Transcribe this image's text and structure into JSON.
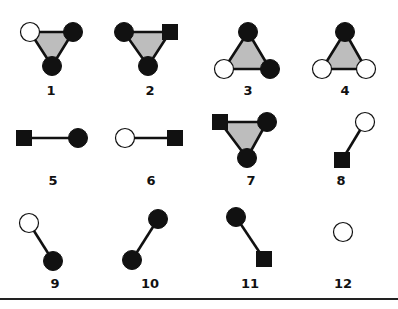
{
  "figure": {
    "legend": {
      "black": "filled black circle node",
      "white": "open white circle node",
      "square": "filled black square node"
    },
    "colors": {
      "stroke": "#111111",
      "triangle_fill": "#bdbdbd",
      "background": "#ffffff"
    },
    "motifs": [
      {
        "id": 1,
        "label": "1",
        "type": "triangle",
        "nodes": [
          {
            "kind": "white",
            "x": 30,
            "y": 32
          },
          {
            "kind": "black",
            "x": 73,
            "y": 32
          },
          {
            "kind": "black",
            "x": 52,
            "y": 66
          }
        ],
        "label_pos": {
          "x": 51,
          "y": 95
        }
      },
      {
        "id": 2,
        "label": "2",
        "type": "triangle",
        "nodes": [
          {
            "kind": "black",
            "x": 124,
            "y": 32
          },
          {
            "kind": "square",
            "x": 170,
            "y": 32
          },
          {
            "kind": "black",
            "x": 148,
            "y": 66
          }
        ],
        "label_pos": {
          "x": 150,
          "y": 95
        }
      },
      {
        "id": 3,
        "label": "3",
        "type": "triangle",
        "nodes": [
          {
            "kind": "black",
            "x": 248,
            "y": 32
          },
          {
            "kind": "white",
            "x": 224,
            "y": 69
          },
          {
            "kind": "black",
            "x": 270,
            "y": 69
          }
        ],
        "label_pos": {
          "x": 248,
          "y": 95
        }
      },
      {
        "id": 4,
        "label": "4",
        "type": "triangle",
        "nodes": [
          {
            "kind": "black",
            "x": 345,
            "y": 32
          },
          {
            "kind": "white",
            "x": 322,
            "y": 69
          },
          {
            "kind": "white",
            "x": 366,
            "y": 69
          }
        ],
        "label_pos": {
          "x": 345,
          "y": 95
        }
      },
      {
        "id": 5,
        "label": "5",
        "type": "edge",
        "nodes": [
          {
            "kind": "square",
            "x": 24,
            "y": 138
          },
          {
            "kind": "black",
            "x": 78,
            "y": 138
          }
        ],
        "label_pos": {
          "x": 53,
          "y": 185
        }
      },
      {
        "id": 6,
        "label": "6",
        "type": "edge",
        "nodes": [
          {
            "kind": "white",
            "x": 125,
            "y": 138
          },
          {
            "kind": "square",
            "x": 175,
            "y": 138
          }
        ],
        "label_pos": {
          "x": 151,
          "y": 185
        }
      },
      {
        "id": 7,
        "label": "7",
        "type": "triangle",
        "nodes": [
          {
            "kind": "square",
            "x": 220,
            "y": 122
          },
          {
            "kind": "black",
            "x": 267,
            "y": 122
          },
          {
            "kind": "black",
            "x": 247,
            "y": 158
          }
        ],
        "label_pos": {
          "x": 251,
          "y": 185
        }
      },
      {
        "id": 8,
        "label": "8",
        "type": "edge",
        "nodes": [
          {
            "kind": "white",
            "x": 365,
            "y": 122
          },
          {
            "kind": "square",
            "x": 342,
            "y": 160
          }
        ],
        "label_pos": {
          "x": 341,
          "y": 185
        }
      },
      {
        "id": 9,
        "label": "9",
        "type": "edge",
        "nodes": [
          {
            "kind": "white",
            "x": 29,
            "y": 223
          },
          {
            "kind": "black",
            "x": 53,
            "y": 261
          }
        ],
        "label_pos": {
          "x": 55,
          "y": 288
        }
      },
      {
        "id": 10,
        "label": "10",
        "type": "edge",
        "nodes": [
          {
            "kind": "black",
            "x": 158,
            "y": 219
          },
          {
            "kind": "black",
            "x": 132,
            "y": 260
          }
        ],
        "label_pos": {
          "x": 150,
          "y": 288
        }
      },
      {
        "id": 11,
        "label": "11",
        "type": "edge",
        "nodes": [
          {
            "kind": "black",
            "x": 236,
            "y": 217
          },
          {
            "kind": "square",
            "x": 264,
            "y": 259
          }
        ],
        "label_pos": {
          "x": 250,
          "y": 288
        }
      },
      {
        "id": 12,
        "label": "12",
        "type": "single",
        "nodes": [
          {
            "kind": "white",
            "x": 343,
            "y": 232
          }
        ],
        "label_pos": {
          "x": 343,
          "y": 288
        }
      }
    ],
    "rule_y": 299
  }
}
